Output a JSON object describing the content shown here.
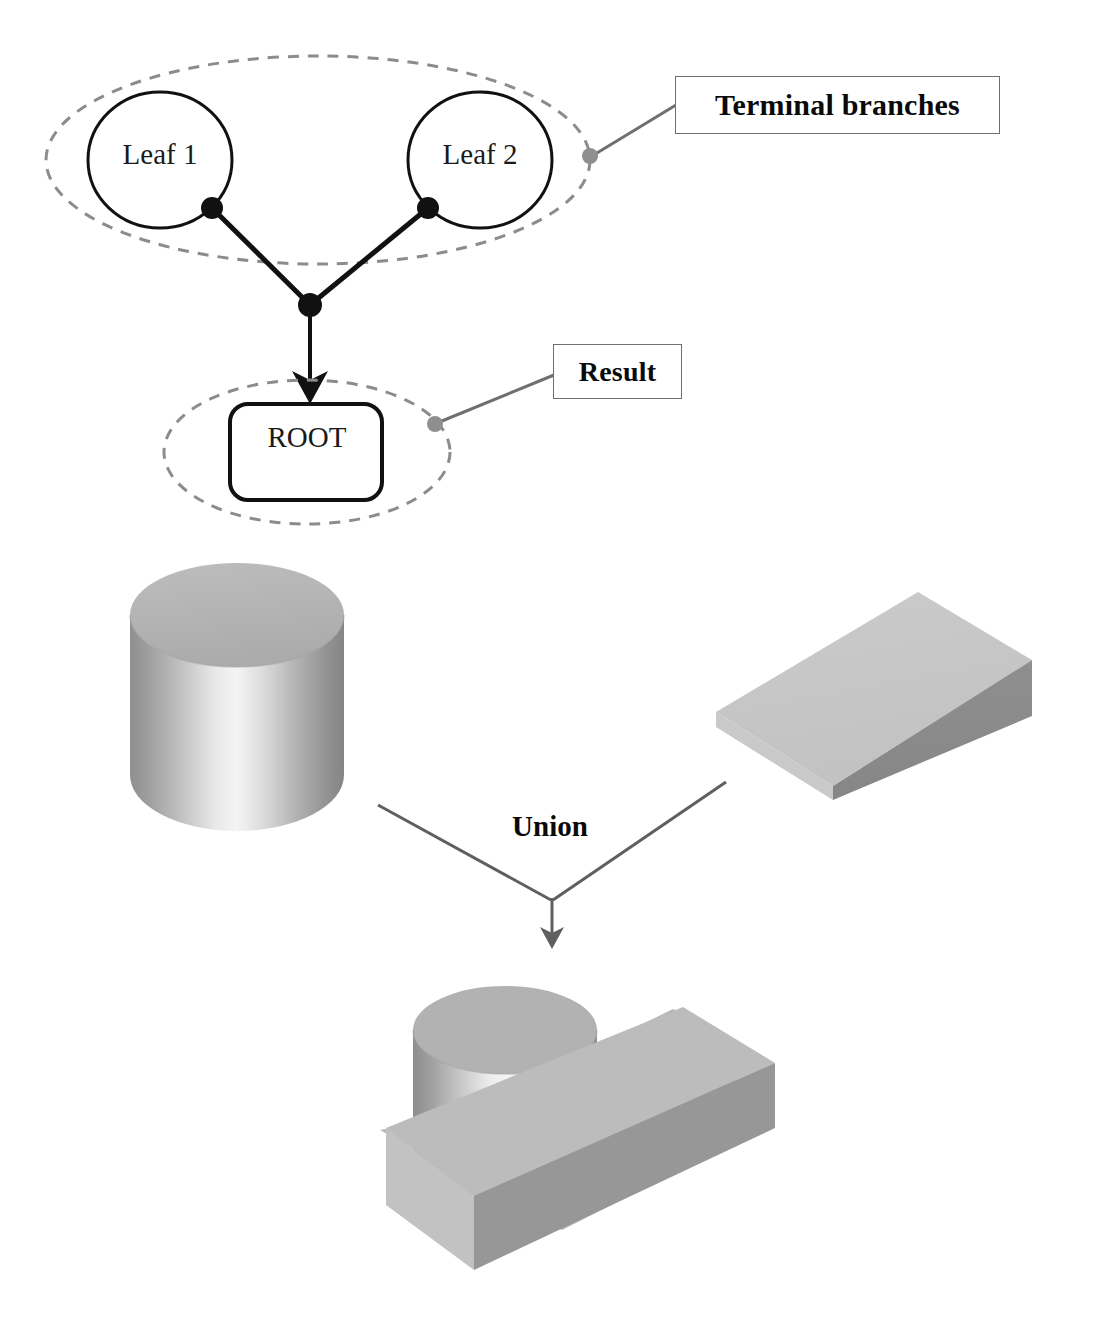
{
  "figure": {
    "type": "csg-union-diagram"
  },
  "tree": {
    "leaf1_label": "Leaf 1",
    "leaf2_label": "Leaf 2",
    "root_label": "ROOT",
    "callouts": [
      {
        "label": "Terminal branches",
        "target": "leaf-group-ellipse"
      },
      {
        "label": "Result",
        "target": "root-group-ellipse"
      }
    ]
  },
  "callouts": {
    "terminal_branches": "Terminal branches",
    "result": "Result"
  },
  "operation": {
    "label": "Union",
    "operands": [
      "cylinder",
      "block"
    ],
    "result": "unioned-solid"
  },
  "solids": {
    "cylinder_name": "cylinder",
    "block_name": "rectangular-block",
    "result_name": "union-result-solid"
  },
  "colors": {
    "line": "#111111",
    "dashed_group": "#8c8c8c",
    "callout_leader": "#6f6f6f",
    "callout_border": "#6f6f6f",
    "solid_light": "#d2d2d2",
    "solid_mid": "#b4b4b4",
    "solid_dark": "#8a8a8a",
    "highlight": "#f2f2f2",
    "background": "#ffffff"
  },
  "top_cropped_text": ""
}
